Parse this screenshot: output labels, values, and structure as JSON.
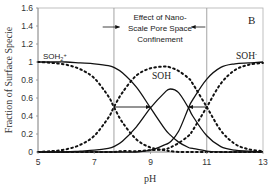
{
  "chart_data": {
    "type": "line",
    "title": "",
    "panel_label": "B",
    "xlabel": "pH",
    "ylabel": "Fraction of Surface Specie",
    "xlim": [
      5,
      13
    ],
    "ylim": [
      0,
      1.6
    ],
    "xticks": [
      5,
      7,
      9,
      11,
      13
    ],
    "yticks": [
      0,
      0.2,
      0.4,
      0.6,
      0.8,
      1,
      1.2,
      1.4,
      1.6
    ],
    "ytick_labels": [
      "0",
      "0.2",
      "0.4",
      "0.6",
      "0.8",
      "1",
      "1.2",
      "1.4",
      "1.6"
    ],
    "grid": false,
    "vertical_lines": [
      7.7,
      11.0
    ],
    "annotation": {
      "lines": [
        "Effect of Nano-",
        "Scale Pore Space",
        "Confinement"
      ],
      "arrows": [
        {
          "from_pH": 7.7,
          "to_pH": 9.0,
          "y": 0.5,
          "note": "SOH2+ / SOH crossing shifts to higher pH"
        },
        {
          "from_pH": 11.0,
          "to_pH": 10.35,
          "y": 0.5,
          "note": "SOH / SOH- crossing shifts to lower pH"
        }
      ]
    },
    "species_labels": [
      {
        "text": "SOH2+",
        "pH": 5.15,
        "y": 1.03
      },
      {
        "text": "SOH",
        "pH": 9.35,
        "y": 0.82
      },
      {
        "text": "SOH-",
        "pH": 12.0,
        "y": 1.03
      }
    ],
    "x": [
      5,
      5.5,
      6,
      6.5,
      7,
      7.5,
      7.7,
      8,
      8.5,
      9,
      9.5,
      9.7,
      10,
      10.35,
      10.5,
      11,
      11.5,
      12,
      12.5,
      13
    ],
    "series": [
      {
        "name": "SOH2+ (confined)",
        "style": "solid",
        "values": [
          1.0,
          1.0,
          1.0,
          0.99,
          0.98,
          0.96,
          0.94,
          0.88,
          0.72,
          0.49,
          0.26,
          0.19,
          0.11,
          0.05,
          0.04,
          0.01,
          0.0,
          0.0,
          0.0,
          0.0
        ]
      },
      {
        "name": "SOH (confined)",
        "style": "solid",
        "values": [
          0.0,
          0.0,
          0.0,
          0.01,
          0.02,
          0.04,
          0.06,
          0.12,
          0.28,
          0.49,
          0.66,
          0.7,
          0.66,
          0.49,
          0.4,
          0.18,
          0.06,
          0.02,
          0.01,
          0.0
        ]
      },
      {
        "name": "SOH- (confined)",
        "style": "solid",
        "values": [
          0.0,
          0.0,
          0.0,
          0.0,
          0.0,
          0.0,
          0.0,
          0.0,
          0.0,
          0.02,
          0.08,
          0.11,
          0.23,
          0.49,
          0.58,
          0.81,
          0.94,
          0.98,
          0.99,
          1.0
        ]
      },
      {
        "name": "SOH2+ (bulk)",
        "style": "dotted",
        "values": [
          1.0,
          0.99,
          0.97,
          0.92,
          0.82,
          0.62,
          0.5,
          0.33,
          0.14,
          0.05,
          0.02,
          0.01,
          0.0,
          0.0,
          0.0,
          0.0,
          0.0,
          0.0,
          0.0,
          0.0
        ]
      },
      {
        "name": "SOH (bulk)",
        "style": "dotted",
        "values": [
          0.0,
          0.01,
          0.03,
          0.08,
          0.18,
          0.38,
          0.5,
          0.66,
          0.85,
          0.93,
          0.95,
          0.94,
          0.9,
          0.82,
          0.76,
          0.5,
          0.24,
          0.09,
          0.03,
          0.01
        ]
      },
      {
        "name": "SOH- (bulk)",
        "style": "dotted",
        "values": [
          0.0,
          0.0,
          0.0,
          0.0,
          0.0,
          0.0,
          0.0,
          0.01,
          0.01,
          0.02,
          0.03,
          0.05,
          0.1,
          0.18,
          0.24,
          0.5,
          0.76,
          0.91,
          0.97,
          0.99
        ]
      }
    ],
    "legend": null
  }
}
